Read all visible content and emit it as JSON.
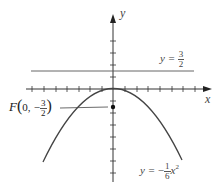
{
  "diagram": {
    "x_axis_label": "x",
    "y_axis_label": "y",
    "directrix": {
      "label_lhs": "y =",
      "numerator": "3",
      "denominator": "2",
      "y_value": 1.5
    },
    "focus": {
      "label_prefix": "F",
      "open": "(",
      "coord_x": "0,",
      "sign": "−",
      "numerator": "3",
      "denominator": "2",
      "close": ")",
      "x": 0,
      "y": -1.5
    },
    "parabola": {
      "label_lhs": "y =",
      "sign": "−",
      "numerator": "1",
      "denominator": "6",
      "var": "x",
      "exp": "2",
      "equation": "y = -1/6 x^2"
    },
    "tick_spacing_units": 0.5,
    "colors": {
      "axes": "#333333",
      "curve": "#444444",
      "directrix": "#555555",
      "text": "#444444"
    }
  }
}
